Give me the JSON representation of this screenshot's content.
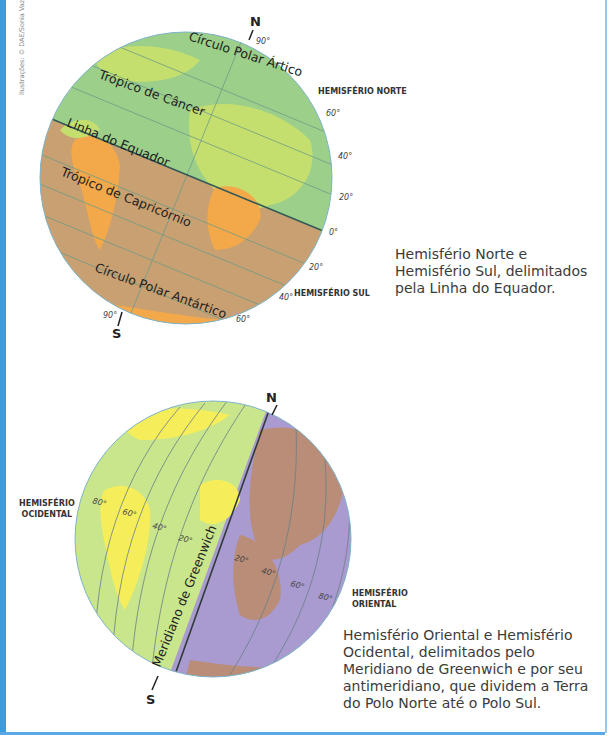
{
  "credit": "Ilustrações: © DAE/Sonia Vaz",
  "figure1": {
    "pole_north": "N",
    "pole_south": "S",
    "north_pole_deg": "90°",
    "south_pole_deg": "90°",
    "lines": {
      "arctic_circle": "Círculo Polar Ártico",
      "tropic_cancer": "Trópico de Câncer",
      "equator": "Linha do Equador",
      "tropic_capricorn": "Trópico de Capricórnio",
      "antarctic_circle": "Círculo Polar Antártico"
    },
    "lat_labels_north": [
      "60°",
      "40°",
      "20°",
      "0°"
    ],
    "lat_labels_south": [
      "20°",
      "40°",
      "60°"
    ],
    "label_north": "HEMISFÉRIO NORTE",
    "label_south": "HEMISFÉRIO SUL",
    "caption": "Hemisfério Norte e Hemisfério Sul, delimitados pela Linha do Equador.",
    "colors": {
      "north": "#9ccf8a",
      "north_land": "#c5df6e",
      "south": "#c9a071",
      "south_land": "#f3a94a"
    }
  },
  "figure2": {
    "pole_north": "N",
    "pole_south": "S",
    "meridian": "Meridiano de Greenwich",
    "meridian_deg": "0°",
    "lon_labels_west": [
      "80°",
      "60°",
      "40°",
      "20°"
    ],
    "lon_labels_east": [
      "20°",
      "40°",
      "60°",
      "80°"
    ],
    "label_west_line1": "HEMISFÉRIO",
    "label_west_line2": "OCIDENTAL",
    "label_east_line1": "HEMISFÉRIO",
    "label_east_line2": "ORIENTAL",
    "caption": "Hemisfério Oriental e Hemisfério Ocidental, delimitados pelo Meridiano de Greenwich e por seu antimeridiano, que dividem a Terra do Polo Norte até o Polo Sul.",
    "colors": {
      "west": "#c9e68c",
      "west_land": "#f5ee5a",
      "east": "#a99ad0",
      "east_land": "#b98d78"
    }
  }
}
